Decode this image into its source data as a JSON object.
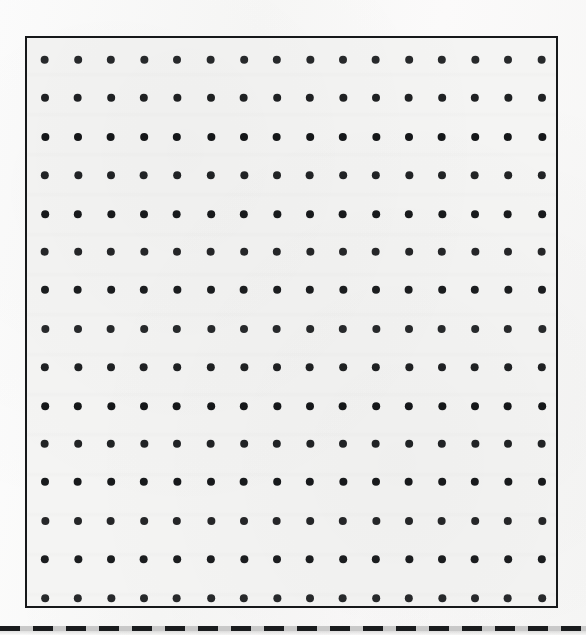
{
  "page": {
    "title": "Dot Grid Notebook Page",
    "width": 586,
    "height": 635,
    "background_color": "#fcfcfc",
    "paper_color": "#f4f4f3"
  },
  "frame": {
    "name": "grid-frame",
    "x": 25,
    "y": 36,
    "width": 533,
    "height": 572,
    "border_color": "#16181a",
    "border_width": 2
  },
  "dot_grid": {
    "columns": 16,
    "rows": 15,
    "dot_diameter": 8,
    "dot_color": "#111315",
    "first_dot_x": 43,
    "first_dot_y": 58,
    "column_spacing": 33.1,
    "row_spacing": 38.4,
    "total_dots": 240
  },
  "dashed_rule": {
    "name": "dashed-rule",
    "y": 626,
    "thickness": 5,
    "dash_length": 20,
    "gap_length": 13,
    "dash_color": "#1a1c1e",
    "gap_color": "#c9c9c9",
    "span_full_width": true
  },
  "labels": {
    "page_region": "dot-grid-sheet",
    "frame_region": "printed-border-rectangle",
    "rule_region": "bottom-dashed-separator"
  }
}
